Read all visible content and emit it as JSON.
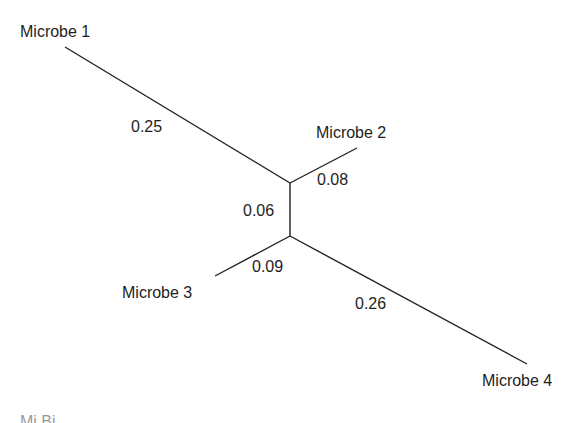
{
  "diagram": {
    "type": "unrooted phylogenetic tree",
    "taxa": [
      {
        "id": "m1",
        "label": "Microbe 1",
        "branch_length": "0.25"
      },
      {
        "id": "m2",
        "label": "Microbe 2",
        "branch_length": "0.08"
      },
      {
        "id": "m3",
        "label": "Microbe 3",
        "branch_length": "0.09"
      },
      {
        "id": "m4",
        "label": "Microbe 4",
        "branch_length": "0.26"
      }
    ],
    "internal_branch": {
      "label": "0.06",
      "connects": [
        "(Microbe 1, Microbe 2)",
        "(Microbe 3, Microbe 4)"
      ]
    },
    "line_color": "#222222",
    "caption_fragment": "Mi Bi"
  }
}
